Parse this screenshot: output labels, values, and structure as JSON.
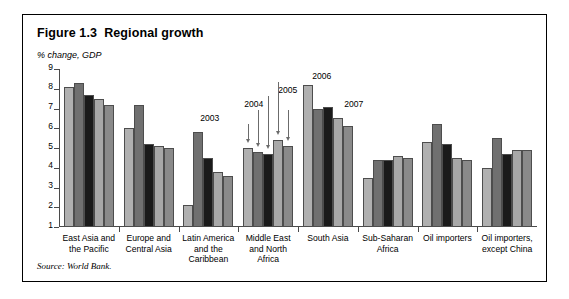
{
  "figure": {
    "title": "Figure 1.3  Regional growth",
    "axis_unit_label": "% change, GDP",
    "source_note": "Source: World Bank."
  },
  "chart_data": {
    "type": "bar",
    "title": "Figure 1.3  Regional growth",
    "xlabel": "",
    "ylabel": "% change, GDP",
    "ylim": [
      1,
      9
    ],
    "yticks": [
      1,
      2,
      3,
      4,
      5,
      6,
      7,
      8,
      9
    ],
    "grid": false,
    "legend_position": "annotated-arrows",
    "annotations": [
      "2003",
      "2004",
      "2005",
      "2006",
      "2007"
    ],
    "categories": [
      "East Asia and\nthe Pacific",
      "Europe and\nCentral Asia",
      "Latin America\nand the\nCaribbean",
      "Middle East\nand North\nAfrica",
      "South Asia",
      "Sub-Saharan\nAfrica",
      "Oil importers",
      "Oil importers,\nexcept China"
    ],
    "series": [
      {
        "name": "2003",
        "color": "#b0b0b0",
        "values": [
          8.1,
          6.0,
          2.1,
          5.0,
          8.2,
          3.5,
          5.3,
          4.0
        ]
      },
      {
        "name": "2004",
        "color": "#707070",
        "values": [
          8.3,
          7.2,
          5.8,
          4.8,
          7.0,
          4.4,
          6.2,
          5.5
        ]
      },
      {
        "name": "2005",
        "color": "#1a1a1a",
        "values": [
          7.7,
          5.2,
          4.5,
          4.7,
          7.1,
          4.4,
          5.2,
          4.7
        ]
      },
      {
        "name": "2006",
        "color": "#a8a8a8",
        "values": [
          7.5,
          5.1,
          3.8,
          5.4,
          6.5,
          4.6,
          4.5,
          4.9
        ]
      },
      {
        "name": "2007",
        "color": "#8a8a8a",
        "values": [
          7.2,
          5.0,
          3.6,
          5.1,
          6.1,
          4.5,
          4.4,
          4.9
        ]
      }
    ]
  }
}
